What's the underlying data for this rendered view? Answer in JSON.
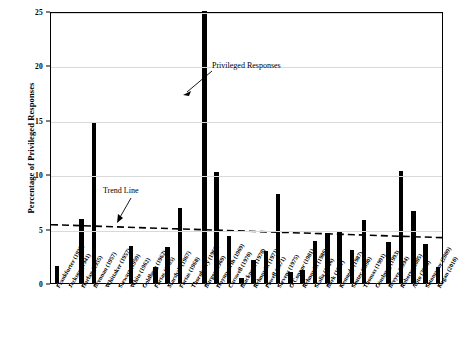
{
  "chart_data": {
    "type": "bar",
    "title": "",
    "xlabel": "",
    "ylabel": "Percentage of Privileged Responses",
    "ylim": [
      0,
      25
    ],
    "yticks": [
      0,
      5,
      10,
      15,
      20,
      25
    ],
    "grid": true,
    "legend": "none",
    "categories": [
      "Frankfurter (1939)",
      "Jackson (1941)",
      "Harlan (1955)",
      "Brennan (1957)",
      "Whittaker (1957)",
      "Stewart (1959)",
      "White (1962)",
      "Goldberg (1962)",
      "Fortas (1965)",
      "Marshall (1967)",
      "Fortas (1968)",
      "Thornberry (1968)",
      "Burger (1969)",
      "Haynsworth (1969)",
      "Carswell (1970)",
      "Blackmun (1970)",
      "Rehnquist (1971)",
      "Powell (1971)",
      "Stevens (1975)",
      "O'Connor (1981)",
      "Rehnquist (1986)",
      "Scalia (1986)",
      "Bork (1987)",
      "Kennedy (1987)",
      "Souter (1990)",
      "Thomas (1991)",
      "Ginsburg (1993)",
      "Breyer (1994)",
      "Roberts (2005)",
      "Alito (2006)",
      "Sotomayor (2009)",
      "Kagan (2010)"
    ],
    "values": [
      1.6,
      0.0,
      5.9,
      14.7,
      0.0,
      0.0,
      3.4,
      0.0,
      1.5,
      3.3,
      6.9,
      0.0,
      25.0,
      10.2,
      4.3,
      0.5,
      2.1,
      2.9,
      8.2,
      1.0,
      1.2,
      3.9,
      4.6,
      4.7,
      3.0,
      5.8,
      0.0,
      3.8,
      10.3,
      6.6,
      3.6,
      1.5
    ],
    "trend_line": {
      "label": "Trend Line",
      "style": "dashed",
      "y_start": 5.4,
      "y_end": 4.2
    },
    "annotations": [
      {
        "text": "Privileged Responses",
        "points_to": "tallest-bar"
      },
      {
        "text": "Trend Line",
        "points_to": "trend-line"
      }
    ]
  }
}
